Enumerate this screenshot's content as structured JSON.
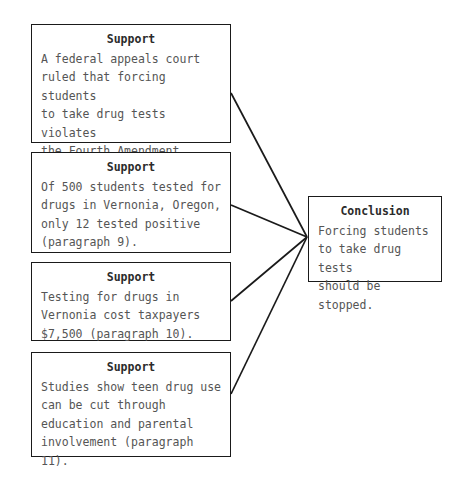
{
  "diagram": {
    "type": "argument-map",
    "title_visible": false,
    "colors": {
      "background": "#ffffff",
      "box_border": "#1a1a1a",
      "heading_text": "#2b2b2b",
      "body_text": "#555555",
      "connector_line": "#1a1a1a"
    },
    "supports": [
      {
        "id": "support-1",
        "heading": "Support",
        "text": "A federal appeals court\nruled that forcing students\nto take drug tests violates\nthe Fourth Amendment\n(paragraph 4).",
        "paragraph_ref": "paragraph 4"
      },
      {
        "id": "support-2",
        "heading": "Support",
        "text": "Of 500 students tested for\ndrugs in Vernonia, Oregon,\nonly 12 tested positive\n(paragraph 9).",
        "paragraph_ref": "paragraph 9"
      },
      {
        "id": "support-3",
        "heading": "Support",
        "text": "Testing for drugs in\nVernonia cost taxpayers\n$7,500 (paragraph 10).",
        "paragraph_ref": "paragraph 10"
      },
      {
        "id": "support-4",
        "heading": "Support",
        "text": "Studies show teen drug use\ncan be cut through\neducation and parental\ninvolvement (paragraph 11).",
        "paragraph_ref": "paragraph 11"
      }
    ],
    "conclusion": {
      "id": "conclusion-1",
      "heading": "Conclusion",
      "text": "Forcing students\nto take drug tests\nshould be stopped."
    },
    "connectors": [
      {
        "from": "support-1",
        "to": "conclusion-1",
        "x1": 231,
        "y1": 93,
        "x2": 307,
        "y2": 237
      },
      {
        "from": "support-2",
        "to": "conclusion-1",
        "x1": 231,
        "y1": 205,
        "x2": 307,
        "y2": 237
      },
      {
        "from": "support-3",
        "to": "conclusion-1",
        "x1": 231,
        "y1": 301,
        "x2": 307,
        "y2": 237
      },
      {
        "from": "support-4",
        "to": "conclusion-1",
        "x1": 231,
        "y1": 394,
        "x2": 307,
        "y2": 237
      }
    ]
  }
}
